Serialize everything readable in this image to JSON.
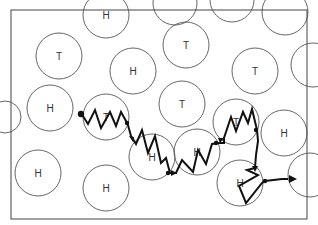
{
  "diagram": {
    "frame": {
      "x": 11,
      "y": 10,
      "w": 296,
      "h": 209
    },
    "circles": [
      {
        "cx": 106,
        "cy": 15,
        "r": 23,
        "label": "H"
      },
      {
        "cx": 175,
        "cy": 3,
        "r": 22,
        "label": ""
      },
      {
        "cx": 232,
        "cy": 0,
        "r": 22,
        "label": ""
      },
      {
        "cx": 285,
        "cy": 12,
        "r": 23,
        "label": ""
      },
      {
        "cx": 59,
        "cy": 56,
        "r": 23,
        "label": "T"
      },
      {
        "cx": 186,
        "cy": 45,
        "r": 23,
        "label": "T"
      },
      {
        "cx": 133,
        "cy": 71,
        "r": 23,
        "label": "H"
      },
      {
        "cx": 255,
        "cy": 71,
        "r": 23,
        "label": "T"
      },
      {
        "cx": 313,
        "cy": 65,
        "r": 22,
        "label": ""
      },
      {
        "cx": 5,
        "cy": 117,
        "r": 16,
        "label": ""
      },
      {
        "cx": 50,
        "cy": 108,
        "r": 23,
        "label": "H"
      },
      {
        "cx": 106,
        "cy": 117,
        "r": 23,
        "label": "T"
      },
      {
        "cx": 182,
        "cy": 104,
        "r": 23,
        "label": "T"
      },
      {
        "cx": 236,
        "cy": 122,
        "r": 23,
        "label": "T"
      },
      {
        "cx": 284,
        "cy": 133,
        "r": 23,
        "label": "H"
      },
      {
        "cx": 152,
        "cy": 157,
        "r": 23,
        "label": "H"
      },
      {
        "cx": 197,
        "cy": 152,
        "r": 23,
        "label": "H"
      },
      {
        "cx": 240,
        "cy": 183,
        "r": 23,
        "label": "H"
      },
      {
        "cx": 310,
        "cy": 175,
        "r": 22,
        "label": ""
      },
      {
        "cx": 38,
        "cy": 173,
        "r": 23,
        "label": "H"
      },
      {
        "cx": 106,
        "cy": 188,
        "r": 23,
        "label": "H"
      }
    ],
    "path_points": "81,113 88,124 95,110 101,128 110,112 116,126 121,112 126,121 128,125 131,136 136,144 142,130 148,153 155,136 161,163 166,158 170,173 176,173 182,160 193,172 198,150 206,164 212,144 219,143 224,143 224,138 231,117 236,131 243,112 248,123 252,109 257,130 258,141 256,155 255,168 247,170 258,175 239,186 246,203 262,183 265,181 282,179 288,179",
    "dots": [
      {
        "x": 81,
        "y": 114,
        "r": 3.2
      },
      {
        "x": 127,
        "y": 123,
        "r": 2.2
      },
      {
        "x": 168,
        "y": 173,
        "r": 2.2
      },
      {
        "x": 216,
        "y": 143,
        "r": 2.2
      },
      {
        "x": 256,
        "y": 130,
        "r": 2.2
      },
      {
        "x": 265,
        "y": 181,
        "r": 2.2
      }
    ],
    "arrows": [
      {
        "points": "129,136 134,137 133,142"
      },
      {
        "points": "171,170 177,173 171,176"
      },
      {
        "points": "218,138 224,138 220,143"
      },
      {
        "points": "252,166 258,166 255,172"
      },
      {
        "points": "289,175 297,179 289,183"
      }
    ]
  }
}
